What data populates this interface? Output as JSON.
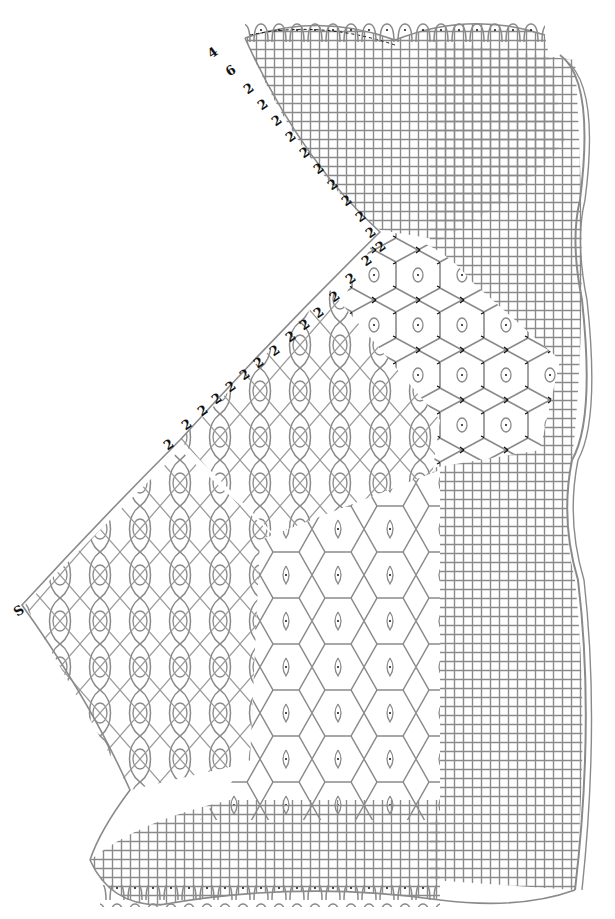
{
  "diagram": {
    "type": "bobbin-lace-working-diagram",
    "background": "#ffffff",
    "thread_color": "#8a8a8a",
    "mark_color": "#111111",
    "top_labels": [
      {
        "text": "4",
        "x": 208,
        "y": 46
      },
      {
        "text": "6",
        "x": 226,
        "y": 64
      }
    ],
    "pair_labels": [
      {
        "text": "2",
        "x": 244,
        "y": 82
      },
      {
        "text": "2",
        "x": 258,
        "y": 98
      },
      {
        "text": "2",
        "x": 272,
        "y": 114
      },
      {
        "text": "2",
        "x": 286,
        "y": 130
      },
      {
        "text": "2",
        "x": 300,
        "y": 146
      },
      {
        "text": "2",
        "x": 314,
        "y": 162
      },
      {
        "text": "2",
        "x": 328,
        "y": 178
      },
      {
        "text": "2",
        "x": 342,
        "y": 194
      },
      {
        "text": "2",
        "x": 356,
        "y": 210
      },
      {
        "text": "2",
        "x": 366,
        "y": 226
      },
      {
        "text": "2",
        "x": 376,
        "y": 240
      },
      {
        "text": "2",
        "x": 362,
        "y": 254
      },
      {
        "text": "2",
        "x": 346,
        "y": 272
      },
      {
        "text": "2",
        "x": 330,
        "y": 290
      },
      {
        "text": "2",
        "x": 314,
        "y": 306
      },
      {
        "text": "2",
        "x": 300,
        "y": 318
      },
      {
        "text": "2",
        "x": 286,
        "y": 330
      },
      {
        "text": "2",
        "x": 270,
        "y": 344
      },
      {
        "text": "2",
        "x": 254,
        "y": 356
      },
      {
        "text": "2",
        "x": 240,
        "y": 368
      },
      {
        "text": "2",
        "x": 226,
        "y": 380
      },
      {
        "text": "2",
        "x": 212,
        "y": 392
      },
      {
        "text": "2",
        "x": 198,
        "y": 404
      },
      {
        "text": "2",
        "x": 182,
        "y": 418
      },
      {
        "text": "2",
        "x": 164,
        "y": 438
      }
    ],
    "left_tip_label": {
      "text": "S",
      "x": 14,
      "y": 604
    },
    "regions": [
      {
        "name": "top-cloth-stitch-fan",
        "stitch": "cloth"
      },
      {
        "name": "right-footside-scalloped-edge",
        "stitch": "cloth-with-picots"
      },
      {
        "name": "upper-hexagon-ground",
        "stitch": "rose-ground"
      },
      {
        "name": "diagonal-torchon-bands",
        "stitch": "half-stitch-crossings"
      },
      {
        "name": "left-tip-diamond-ground",
        "stitch": "torchon"
      },
      {
        "name": "lower-spider-ground",
        "stitch": "spider-hexagons"
      },
      {
        "name": "bottom-cloth-stitch-band",
        "stitch": "cloth"
      }
    ]
  }
}
